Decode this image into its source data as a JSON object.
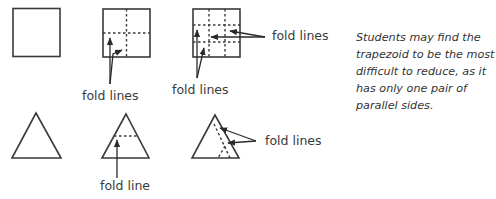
{
  "diagram": {
    "labels": {
      "square2_fold": "fold lines",
      "square3_fold_bottom": "fold lines",
      "square3_fold_right": "fold lines",
      "triangle2_fold": "fold line",
      "triangle3_fold": "fold lines"
    },
    "shapes": [
      {
        "id": "square-plain",
        "type": "square"
      },
      {
        "id": "square-quartered",
        "type": "square",
        "fold_lines": 2
      },
      {
        "id": "square-ninths",
        "type": "square",
        "fold_lines": 4
      },
      {
        "id": "triangle-plain",
        "type": "triangle"
      },
      {
        "id": "triangle-one-fold",
        "type": "triangle",
        "fold_lines": 1
      },
      {
        "id": "triangle-two-folds",
        "type": "triangle",
        "fold_lines": 2
      }
    ],
    "colors": {
      "stroke": "#3a3a3a",
      "text": "#333333"
    }
  },
  "note": {
    "text": "Students may find the trapezoid to be the most difficult to reduce, as it has only one pair of parallel sides."
  }
}
